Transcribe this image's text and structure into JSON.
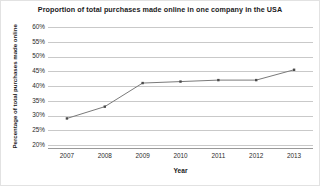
{
  "chart_data": {
    "type": "line",
    "title": "Proportion of total purchases made online in one company in the USA",
    "xlabel": "Year",
    "ylabel": "Percentage of total purchases made online",
    "categories": [
      "2007",
      "2008",
      "2009",
      "2010",
      "2011",
      "2012",
      "2013"
    ],
    "x": [
      2007,
      2008,
      2009,
      2010,
      2011,
      2012,
      2013
    ],
    "values": [
      29,
      33,
      41,
      41.5,
      42,
      42,
      45.5
    ],
    "series": [
      {
        "name": "Proportion of total purchases made online",
        "values": [
          29,
          33,
          41,
          41.5,
          42,
          42,
          45.5
        ]
      }
    ],
    "ylim": [
      20,
      60
    ],
    "ytick_values": [
      60,
      55,
      50,
      45,
      40,
      35,
      30,
      25,
      20
    ],
    "ytick_labels": [
      "60%",
      "55%",
      "50%",
      "45%",
      "40%",
      "35%",
      "30%",
      "25%",
      "20%"
    ],
    "xtick_labels": [
      "2007",
      "2008",
      "2009",
      "2010",
      "2011",
      "2012",
      "2013"
    ],
    "grid": "horizontal",
    "legend": "none",
    "line_color": "#7a7a7a",
    "marker_color": "#4a4a4a",
    "marker_shape": "square",
    "gridline_color": "#c9c9c9",
    "axis_color": "#9a9a9a",
    "background_color": "#ffffff",
    "text_color": "#1a1a1a"
  }
}
